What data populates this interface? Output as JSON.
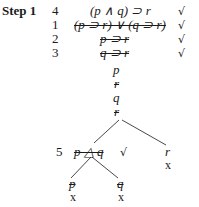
{
  "step": {
    "label": "Step 1"
  },
  "rows": [
    {
      "number": "4",
      "formula": "(p ∧ q) ⊃ r",
      "struck": false,
      "check": "√"
    },
    {
      "number": "1",
      "formula": "(p ⊃ r) ∨ (q ⊃ r)",
      "struck": true,
      "check": "√"
    },
    {
      "number": "2",
      "formula": "p ⊃ r",
      "struck": true,
      "check": "√"
    },
    {
      "number": "3",
      "formula": "q ⊃ r",
      "struck": true,
      "check": "√"
    }
  ],
  "trunk": [
    {
      "formula": "p",
      "struck": false
    },
    {
      "formula": "r",
      "struck": true
    },
    {
      "formula": "q",
      "struck": false
    },
    {
      "formula": "r",
      "struck": true
    }
  ],
  "branch_left": {
    "number": "5",
    "formula": "p △ q",
    "struck": true,
    "check": "√",
    "children": [
      {
        "formula": "p",
        "struck": true,
        "closed": "x"
      },
      {
        "formula": "q",
        "struck": true,
        "closed": "x"
      }
    ]
  },
  "branch_right": {
    "formula": "r",
    "struck": false,
    "closed": "x"
  }
}
